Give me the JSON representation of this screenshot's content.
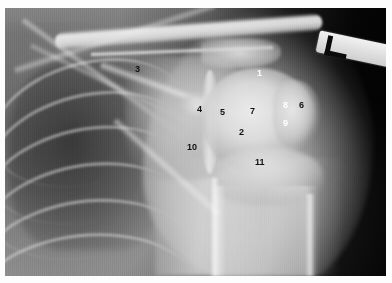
{
  "image": {
    "kind": "radiograph",
    "modality": "X-ray",
    "view": "shoulder anteroposterior (AP)",
    "border_color": "#fdfdfd",
    "background_color": "#000000"
  },
  "side_marker": {
    "name": "left-side-marker",
    "letter": "L",
    "plate_color": "#e2e2e2",
    "glyph_color": "#0a0a0a"
  },
  "annotations": {
    "dark_color": "#111111",
    "light_color": "#ffffff",
    "items": [
      {
        "id": "label-1",
        "text": "1",
        "x": 252,
        "y": 61,
        "tone": "light"
      },
      {
        "id": "label-2",
        "text": "2",
        "x": 234,
        "y": 120,
        "tone": "dark"
      },
      {
        "id": "label-3",
        "text": "3",
        "x": 130,
        "y": 57,
        "tone": "dark"
      },
      {
        "id": "label-4",
        "text": "4",
        "x": 192,
        "y": 97,
        "tone": "dark"
      },
      {
        "id": "label-5",
        "text": "5",
        "x": 215,
        "y": 100,
        "tone": "dark"
      },
      {
        "id": "label-6",
        "text": "6",
        "x": 294,
        "y": 93,
        "tone": "dark"
      },
      {
        "id": "label-7",
        "text": "7",
        "x": 245,
        "y": 99,
        "tone": "dark"
      },
      {
        "id": "label-8",
        "text": "8",
        "x": 278,
        "y": 93,
        "tone": "light"
      },
      {
        "id": "label-9",
        "text": "9",
        "x": 278,
        "y": 111,
        "tone": "light"
      },
      {
        "id": "label-10",
        "text": "10",
        "x": 182,
        "y": 135,
        "tone": "dark"
      },
      {
        "id": "label-11",
        "text": "11",
        "x": 250,
        "y": 150,
        "tone": "dark"
      }
    ]
  },
  "ribs": [
    {
      "left": -16,
      "top": 54,
      "width": 196,
      "height": 118,
      "rotate": -16
    },
    {
      "left": -20,
      "top": 86,
      "width": 204,
      "height": 124,
      "rotate": -14
    },
    {
      "left": -24,
      "top": 120,
      "width": 210,
      "height": 126,
      "rotate": -12
    },
    {
      "left": -26,
      "top": 156,
      "width": 214,
      "height": 128,
      "rotate": -10
    },
    {
      "left": -28,
      "top": 192,
      "width": 216,
      "height": 126,
      "rotate": -8
    },
    {
      "left": -30,
      "top": 226,
      "width": 218,
      "height": 120,
      "rotate": -6
    }
  ]
}
